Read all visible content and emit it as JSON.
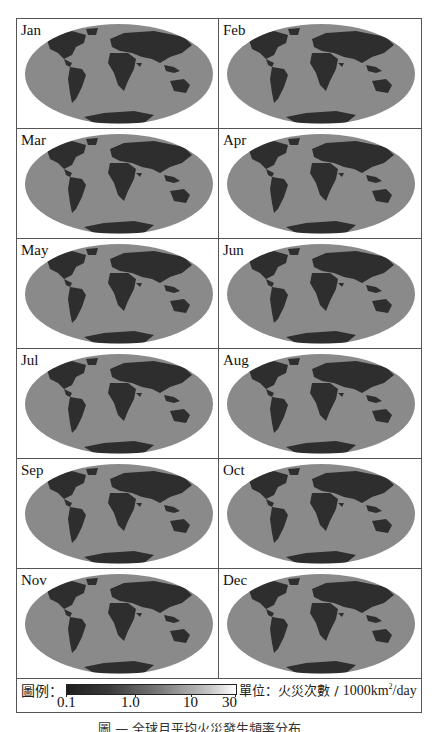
{
  "figure": {
    "panels": [
      {
        "month": "Jan"
      },
      {
        "month": "Feb"
      },
      {
        "month": "Mar"
      },
      {
        "month": "Apr"
      },
      {
        "month": "May"
      },
      {
        "month": "Jun"
      },
      {
        "month": "Jul"
      },
      {
        "month": "Aug"
      },
      {
        "month": "Sep"
      },
      {
        "month": "Oct"
      },
      {
        "month": "Nov"
      },
      {
        "month": "Dec"
      }
    ],
    "legend": {
      "label": "圖例：",
      "ticks": [
        "0.1",
        "1.0",
        "10",
        "30"
      ],
      "unit_prefix": "單位：火災次數 / ",
      "unit_value": "1000km",
      "unit_sup": "2",
      "unit_suffix": "/day"
    },
    "caption": "圖 — 全球月平均火災發生頻率分布"
  },
  "colors": {
    "ocean": "#8a8a8a",
    "land": "#2e2e2e",
    "border": "#555555"
  }
}
